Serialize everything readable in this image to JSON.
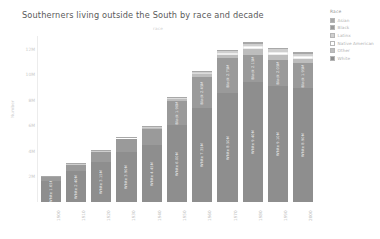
{
  "chart_data": {
    "type": "bar",
    "subtype": "stacked",
    "title": "Southerners living outside the South by race and decade",
    "top_note": "race",
    "xlabel": "",
    "ylabel": "Number",
    "categories": [
      "1900",
      "1910",
      "1920",
      "1930",
      "1940",
      "1950",
      "1960",
      "1970",
      "1980",
      "1990",
      "2000"
    ],
    "xtick_labels": [
      "1900",
      "1910",
      "1920",
      "1930",
      "1940",
      "1950",
      "1960",
      "1970",
      "1980",
      "1990",
      "2000"
    ],
    "ytick_labels": [
      "12M",
      "10M",
      "8M",
      "6M",
      "4M",
      "2M"
    ],
    "ytick_values": [
      12000000,
      10000000,
      8000000,
      6000000,
      4000000,
      2000000
    ],
    "ylim": [
      0,
      13000000
    ],
    "grid": false,
    "legend_position": "right",
    "legend_title": "Race",
    "series": [
      {
        "name": "White",
        "color": "#8e8e8e",
        "values": [
          1650000,
          2400000,
          3150000,
          3900000,
          4450000,
          6000000,
          7350000,
          8500000,
          9400000,
          9100000,
          8900000
        ]
      },
      {
        "name": "Black",
        "color": "#9a9a9a",
        "values": [
          330000,
          520000,
          760000,
          1020000,
          1250000,
          1900000,
          2450000,
          2750000,
          2150000,
          2050000,
          1950000
        ]
      },
      {
        "name": "Other",
        "color": "#bdbdbd",
        "values": [
          30000,
          45000,
          60000,
          80000,
          100000,
          150000,
          210000,
          290000,
          430000,
          400000,
          380000
        ]
      },
      {
        "name": "Native American",
        "color": "#ffffff",
        "values": [
          18000,
          25000,
          34000,
          44000,
          56000,
          80000,
          110000,
          150000,
          220000,
          210000,
          200000
        ]
      },
      {
        "name": "Latinx",
        "color": "#cfcfcf",
        "values": [
          12000,
          18000,
          26000,
          36000,
          48000,
          70000,
          95000,
          130000,
          190000,
          185000,
          180000
        ]
      },
      {
        "name": "Asian",
        "color": "#a8a8a8",
        "values": [
          8000,
          12000,
          18000,
          25000,
          34000,
          50000,
          70000,
          95000,
          140000,
          135000,
          130000
        ]
      }
    ],
    "totals": [
      2048000,
      3020000,
      4048000,
      5105000,
      5938000,
      8250000,
      10285000,
      11915000,
      12530000,
      12080000,
      11740000
    ],
    "bar_labels": [
      [
        "White 1.65M",
        "Black 0.33M"
      ],
      [
        "White 2.40M",
        "Black 0.52M"
      ],
      [
        "White 3.15M",
        "Black 0.76M"
      ],
      [
        "White 3.90M",
        "Black 1.02M"
      ],
      [
        "White 4.45M",
        "Black 1.25M"
      ],
      [
        "White 6.00M",
        "Black 1.90M"
      ],
      [
        "White 7.35M",
        "Black 2.45M"
      ],
      [
        "White 8.50M",
        "Black 2.75M"
      ],
      [
        "White 9.40M",
        "Black 2.15M"
      ],
      [
        "White 9.10M",
        "Black 2.05M"
      ],
      [
        "White 8.90M",
        "Black 1.95M"
      ]
    ]
  },
  "legend": {
    "title": "Race",
    "items": [
      {
        "label": "Asian",
        "color": "#a8a8a8"
      },
      {
        "label": "Black",
        "color": "#9a9a9a"
      },
      {
        "label": "Latinx",
        "color": "#cfcfcf"
      },
      {
        "label": "Native American",
        "color": "#ffffff"
      },
      {
        "label": "Other",
        "color": "#bdbdbd"
      },
      {
        "label": "White",
        "color": "#8e8e8e"
      }
    ]
  }
}
